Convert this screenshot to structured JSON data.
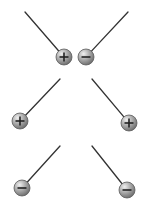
{
  "diagram": {
    "colors": {
      "background": "#ffffff",
      "thread": "#333333",
      "ball_light": "#e6e6e6",
      "ball_mid": "#a8a8a8",
      "ball_dark": "#6e6e6e",
      "sign": "#222222"
    },
    "pairs": [
      {
        "label": "opposite charges attract",
        "balls": [
          {
            "charge": "+",
            "anchor": [
              25,
              12
            ],
            "center": [
              64,
              57
            ]
          },
          {
            "charge": "-",
            "anchor": [
              128,
              12
            ],
            "center": [
              86,
              57
            ]
          }
        ]
      },
      {
        "label": "positive charges repel",
        "balls": [
          {
            "charge": "+",
            "anchor": [
              60,
              79
            ],
            "center": [
              20,
              121
            ]
          },
          {
            "charge": "+",
            "anchor": [
              92,
              79
            ],
            "center": [
              129,
              123
            ]
          }
        ]
      },
      {
        "label": "negative charges repel",
        "balls": [
          {
            "charge": "-",
            "anchor": [
              60,
              146
            ],
            "center": [
              22,
              188
            ]
          },
          {
            "charge": "-",
            "anchor": [
              92,
              146
            ],
            "center": [
              127,
              190
            ]
          }
        ]
      }
    ],
    "ball_radius": 8
  }
}
